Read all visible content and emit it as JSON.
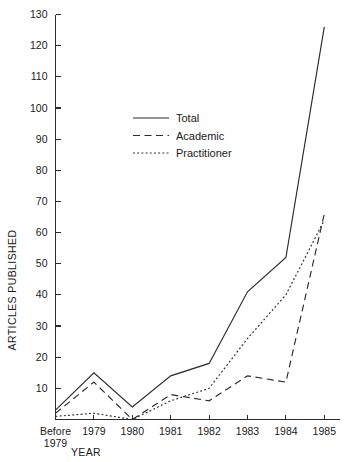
{
  "chart_data": {
    "type": "line",
    "title": "",
    "subtitle": "",
    "xlabel": "YEAR",
    "ylabel": "ARTICLES PUBLISHED",
    "categories": [
      "Before 1979",
      "1979",
      "1980",
      "1981",
      "1982",
      "1983",
      "1984",
      "1985"
    ],
    "x_tick_labels": [
      "Before\n1979",
      "1979",
      "1980",
      "1981",
      "1982",
      "1983",
      "1984",
      "1985"
    ],
    "x_tick_label_line1": [
      "Before",
      "1979",
      "1980",
      "1981",
      "1982",
      "1983",
      "1984",
      "1985"
    ],
    "x_tick_label_line2": [
      "1979",
      "",
      "",
      "",
      "",
      "",
      "",
      ""
    ],
    "y_tick_labels": [
      "10",
      "20",
      "30",
      "40",
      "50",
      "60",
      "70",
      "80",
      "90",
      "100",
      "110",
      "120",
      "130"
    ],
    "y_ticks": [
      10,
      20,
      30,
      40,
      50,
      60,
      70,
      80,
      90,
      100,
      110,
      120,
      130
    ],
    "ylim": [
      0,
      130
    ],
    "xlim": [
      0,
      7
    ],
    "grid": false,
    "legend_position": "upper-center-left",
    "series": [
      {
        "name": "Total",
        "style": "solid",
        "values": [
          3,
          15,
          4,
          14,
          18,
          41,
          52,
          126
        ]
      },
      {
        "name": "Academic",
        "style": "dashed",
        "values": [
          2,
          12,
          0,
          8,
          6,
          14,
          12,
          66
        ]
      },
      {
        "name": "Practitioner",
        "style": "dotted",
        "values": [
          1,
          2,
          0,
          6,
          10,
          26,
          40,
          64
        ]
      }
    ]
  },
  "legend": {
    "entries": [
      {
        "label": "Total",
        "style": "solid"
      },
      {
        "label": "Academic",
        "style": "dashed"
      },
      {
        "label": "Practitioner",
        "style": "dotted"
      }
    ]
  },
  "axes": {
    "y_title": "ARTICLES PUBLISHED",
    "x_title": "YEAR"
  },
  "colors": {
    "ink": "#2b2b2b",
    "background": "#ffffff"
  }
}
